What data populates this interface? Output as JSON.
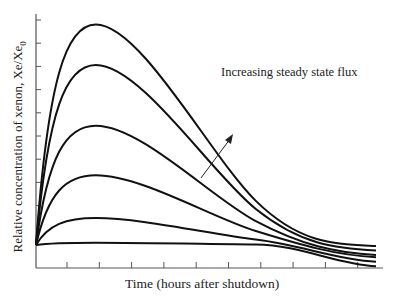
{
  "chart_data": {
    "type": "line",
    "title": "",
    "xlabel": "Time (hours after shutdown)",
    "ylabel": "Relative concentration of xenon, Xe/Xe0",
    "ylabel_parts": {
      "main": "Relative concentration of xenon,  Xe/Xe",
      "subscript": "0"
    },
    "annotation": "Increasing steady state flux",
    "x_ticks_count": 10,
    "y_ticks_count": 10,
    "tick_labels": "none",
    "grid": false,
    "x_range_relative": [
      0,
      1
    ],
    "y_range_relative": [
      0,
      1
    ],
    "series": [
      {
        "name": "flux level 1 (lowest)",
        "start": 0.0,
        "peak": 0.01,
        "peak_x": 0.17,
        "end": -0.05
      },
      {
        "name": "flux level 2",
        "start": 0.0,
        "peak": 0.12,
        "peak_x": 0.17,
        "end": -0.03
      },
      {
        "name": "flux level 3",
        "start": 0.0,
        "peak": 0.31,
        "peak_x": 0.17,
        "end": -0.01
      },
      {
        "name": "flux level 4",
        "start": 0.0,
        "peak": 0.53,
        "peak_x": 0.17,
        "end": 0.0
      },
      {
        "name": "flux level 5",
        "start": 0.0,
        "peak": 0.8,
        "peak_x": 0.17,
        "end": 0.02
      },
      {
        "name": "flux level 6 (highest)",
        "start": 0.0,
        "peak": 0.98,
        "peak_x": 0.17,
        "end": 0.04
      }
    ]
  },
  "labels": {
    "ylabel_main": "Relative concentration of xenon,  Xe/Xe",
    "ylabel_sub": "0",
    "xlabel": "Time (hours after shutdown)",
    "annotation": "Increasing steady state flux"
  }
}
